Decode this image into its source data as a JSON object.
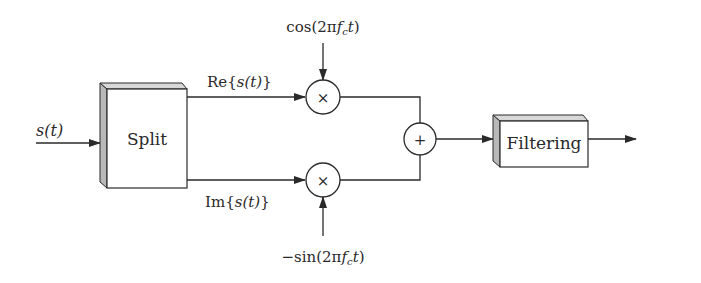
{
  "diagram": {
    "title": "",
    "input_signal": "s(t)",
    "blocks": {
      "split": "Split",
      "filtering": "Filtering"
    },
    "branches": {
      "real": {
        "prefix": "Re{",
        "sig": "s(t)",
        "suffix": "}"
      },
      "imag": {
        "prefix": "Im{",
        "sig": "s(t)",
        "suffix": "}"
      }
    },
    "carriers": {
      "cos": {
        "pre": "cos(2π",
        "f": "f",
        "sub": "c",
        "t": "t",
        "post": ")"
      },
      "sin": {
        "pre": "−sin(2π",
        "f": "f",
        "sub": "c",
        "t": "t",
        "post": ")"
      }
    },
    "operators": {
      "multiply": "×",
      "sum": "+"
    },
    "colors": {
      "line": "#2a2a2a",
      "box_face": "#ffffff",
      "box_side": "#b8b8b8",
      "box_top": "#d8d8d8"
    }
  }
}
